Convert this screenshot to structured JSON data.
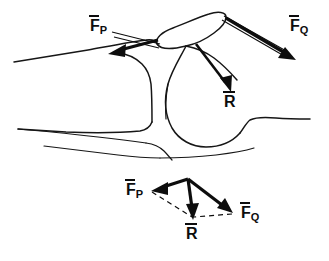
{
  "figure": {
    "background_color": "#ffffff",
    "ink_color": "#0d0d0d",
    "width": 329,
    "height": 261
  },
  "anatomy_panel": {
    "name": "knee-joint-line-drawing",
    "parts": [
      {
        "name": "patella",
        "label": ""
      },
      {
        "name": "femoral-condyle",
        "label": ""
      },
      {
        "name": "femur-shaft",
        "label": ""
      },
      {
        "name": "tibia",
        "label": ""
      },
      {
        "name": "quadriceps-tendon",
        "label": ""
      },
      {
        "name": "patellar-tendon",
        "label": ""
      }
    ],
    "vectors": [
      {
        "id": "fp",
        "base": "F",
        "subscript": "P",
        "overbar": true,
        "label": "F̅P",
        "description": "quadriceps tendon force",
        "direction": "down-left"
      },
      {
        "id": "fq",
        "base": "F",
        "subscript": "Q",
        "overbar": true,
        "label": "F̅Q",
        "description": "patellar tendon force",
        "direction": "down-right"
      },
      {
        "id": "r",
        "base": "R",
        "subscript": "",
        "overbar": true,
        "label": "R̅",
        "description": "resultant joint reaction force",
        "direction": "down"
      }
    ]
  },
  "vector_panel": {
    "name": "force-parallelogram-diagram",
    "vectors": [
      {
        "id": "fp",
        "base": "F",
        "subscript": "P",
        "overbar": true,
        "label": "F̅P",
        "style": "solid",
        "description": "component vector pointing down-left"
      },
      {
        "id": "fq",
        "base": "F",
        "subscript": "Q",
        "overbar": true,
        "label": "F̅Q",
        "style": "solid",
        "description": "component vector pointing down-right"
      },
      {
        "id": "r",
        "base": "R",
        "subscript": "",
        "overbar": true,
        "label": "R̅",
        "style": "solid",
        "description": "resultant vector pointing down"
      }
    ],
    "construction_lines": {
      "style": "dashed",
      "description": "parallelogram completion lines from F̅P and F̅Q tips to R̅ tip"
    }
  }
}
